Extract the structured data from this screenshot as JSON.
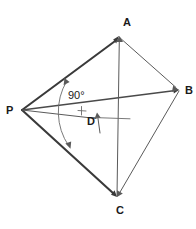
{
  "figure": {
    "background_color": "#ffffff",
    "ink_color": "#3a3a3a",
    "width": 196,
    "height": 229
  },
  "labels": {
    "point_a": "A",
    "point_b": "B",
    "point_c": "C",
    "point_d": "D",
    "point_p": "P",
    "angle_p": "90°"
  },
  "points": {
    "A": {
      "x": 119,
      "y": 36,
      "label_x": 123,
      "label_y": 26
    },
    "B": {
      "x": 179,
      "y": 90,
      "label_x": 185,
      "label_y": 92
    },
    "C": {
      "x": 117,
      "y": 197,
      "label_x": 120,
      "label_y": 213
    },
    "D": {
      "x": 97,
      "y": 121,
      "label_x": 89,
      "label_y": 124
    },
    "P": {
      "x": 22,
      "y": 110,
      "label_x": 11,
      "label_y": 114
    }
  },
  "segments": [
    {
      "name": "PA",
      "from": "P",
      "to": "A",
      "weight": "thick",
      "arrow_at_end": true
    },
    {
      "name": "PB",
      "from": "P",
      "to": "B",
      "weight": "medium",
      "arrow_at_end": true
    },
    {
      "name": "PC",
      "from": "P",
      "to": "C",
      "weight": "thick",
      "arrow_at_end": true
    },
    {
      "name": "PD",
      "from": "P",
      "to": "D",
      "weight": "thin",
      "arrow_at_end": false
    },
    {
      "name": "AB",
      "from": "A",
      "to": "B",
      "weight": "thin",
      "arrow_at_end": true
    },
    {
      "name": "CA",
      "from": "C",
      "to": "A",
      "weight": "thin",
      "arrow_at_end": true
    },
    {
      "name": "BC",
      "from": "B",
      "to": "C",
      "weight": "thin",
      "arrow_at_end": true
    },
    {
      "name": "D-up",
      "from": "D-below",
      "to": "D",
      "weight": "thin",
      "arrow_at_end": true
    }
  ],
  "angle_arc": {
    "name": "angle-arc-APC",
    "center": "P",
    "radius": 60,
    "arrow_at_both_ends": true,
    "tick_mark": true
  },
  "d_guide_line": {
    "name": "d-horizontal-guide",
    "x1": 93,
    "x2": 130,
    "y": 118
  }
}
